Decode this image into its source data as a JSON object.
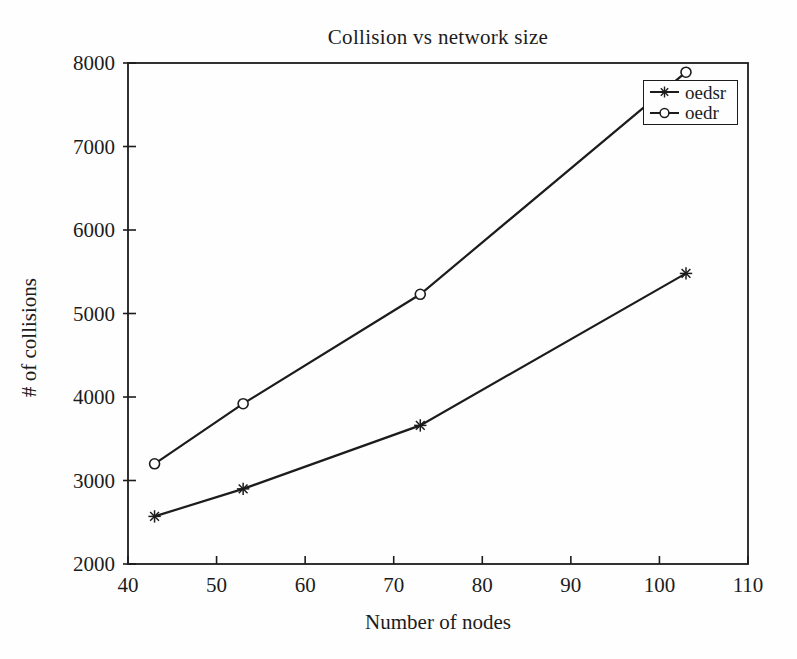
{
  "chart_data": {
    "type": "line",
    "title": "Collision vs network size",
    "xlabel": "Number of nodes",
    "ylabel": "# of collisions",
    "x": [
      43,
      53,
      73,
      103
    ],
    "series": [
      {
        "name": "oedsr",
        "marker": "asterisk",
        "values": [
          2570,
          2900,
          3660,
          5480
        ]
      },
      {
        "name": "oedr",
        "marker": "circle",
        "values": [
          3200,
          3920,
          5230,
          7890
        ]
      }
    ],
    "xlim": [
      40,
      110
    ],
    "ylim": [
      2000,
      8000
    ],
    "xticks": [
      40,
      50,
      60,
      70,
      80,
      90,
      100,
      110
    ],
    "yticks": [
      2000,
      3000,
      4000,
      5000,
      6000,
      7000,
      8000
    ],
    "grid": false,
    "legend_position": "top-right",
    "line_color": "#1c1c1c",
    "background_color": "#fefefe"
  }
}
